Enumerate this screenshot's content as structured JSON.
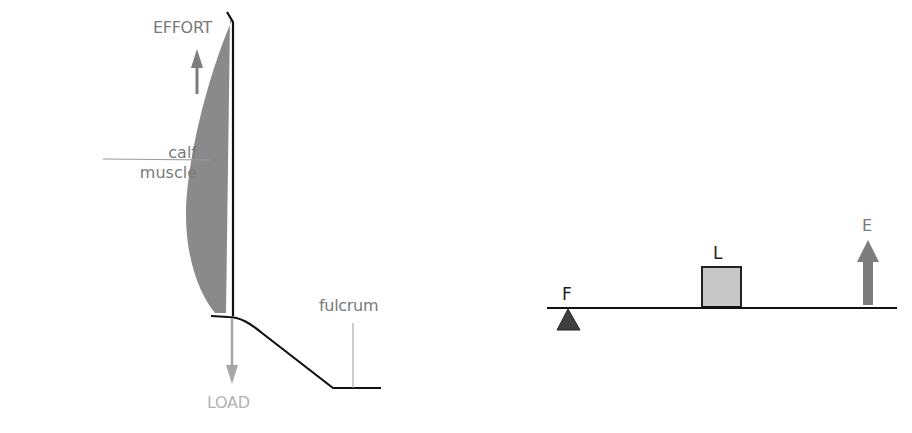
{
  "leg_diagram": {
    "labels": {
      "effort": "EFFORT",
      "calf_line1": "calf",
      "calf_line2": "muscle",
      "fulcrum": "fulcrum",
      "load": "LOAD"
    },
    "colors": {
      "muscle_fill": "#8a8a8a",
      "bone_stroke": "#111111",
      "effort_arrow": "#7d7d7d",
      "load_arrow": "#a6a6a6",
      "label_text": "#7a7a7a",
      "load_text": "#b3b3b3",
      "leader_line": "#9a9a9a"
    }
  },
  "lever_diagram": {
    "labels": {
      "fulcrum": "F",
      "load": "L",
      "effort": "E"
    },
    "colors": {
      "beam": "#111111",
      "fulcrum_triangle": "#3f3f3f",
      "load_box_fill": "#c8c8c8",
      "load_box_stroke": "#222222",
      "effort_arrow": "#7d7d7d"
    }
  }
}
